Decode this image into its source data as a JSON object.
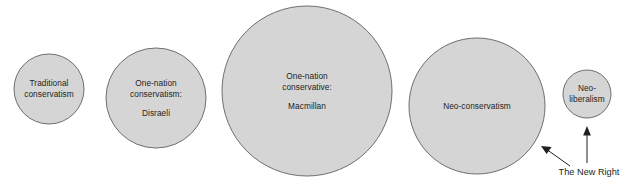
{
  "diagram": {
    "background_color": "#ffffff",
    "circle_fill": "#d5d5d5",
    "circle_stroke": "#6e6e6e",
    "text_color": "#231f20",
    "nodes": [
      {
        "id": "traditional-conservatism",
        "label_main": "Traditional\nconservatism",
        "line1": "Traditional",
        "line2": "conservatism",
        "sub": "",
        "cx": 49,
        "cy": 89,
        "r": 35
      },
      {
        "id": "one-nation-conservatism-disraeli",
        "label_main": "One-nation\nconservatism:",
        "line1": "One-nation",
        "line2": "conservatism:",
        "sub": "Disraeli",
        "cx": 156,
        "cy": 98,
        "r": 50
      },
      {
        "id": "one-nation-conservative-macmillan",
        "label_main": "One-nation\nconservative:",
        "line1": "One-nation",
        "line2": "conservative:",
        "sub": "Macmillan",
        "cx": 307,
        "cy": 91,
        "r": 85
      },
      {
        "id": "neo-conservatism",
        "label_main": "Neo-conservatism",
        "line1": "Neo-conservatism",
        "line2": "",
        "sub": "",
        "cx": 477,
        "cy": 106,
        "r": 68
      },
      {
        "id": "neo-liberalism",
        "label_main": "Neo-\nliberalism",
        "line1": "Neo-",
        "line2": "liberalism",
        "sub": "",
        "cx": 587,
        "cy": 94,
        "r": 24
      }
    ],
    "annotation": {
      "text": "The New Right",
      "x": 589,
      "y": 172
    },
    "arrows": [
      {
        "id": "arrow-to-neo-conservatism",
        "from_x": 570,
        "from_y": 166,
        "to_x": 541,
        "to_y": 146
      },
      {
        "id": "arrow-to-neo-liberalism",
        "from_x": 587,
        "from_y": 163,
        "to_x": 587,
        "to_y": 126
      }
    ]
  }
}
